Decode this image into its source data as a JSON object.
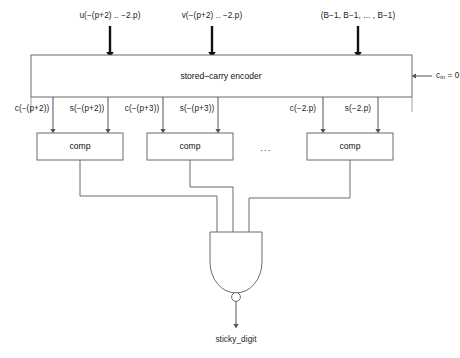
{
  "diagram": {
    "colors": {
      "line": "#6b6b6b",
      "arrow_bold": "#111111",
      "text": "#1a1a1a",
      "background": "#ffffff"
    },
    "inputs": [
      {
        "id": "u-input",
        "label": "u(−(p+2) .. −2.p)"
      },
      {
        "id": "v-input",
        "label": "v(−(p+2) .. −2.p)"
      },
      {
        "id": "b-input",
        "label": "(B−1, B−1, ... , B−1)"
      }
    ],
    "encoder": {
      "label": "stored–carry encoder",
      "carry_in_label": "c",
      "carry_in_sub": "in",
      "carry_in_value": " = 0"
    },
    "encoder_outputs": [
      {
        "id": "c-p2",
        "label": "c(−(p+2))"
      },
      {
        "id": "s-p2",
        "label": "s(−(p+2))"
      },
      {
        "id": "c-p3",
        "label": "c(−(p+3))"
      },
      {
        "id": "s-p3",
        "label": "s(−(p+3))"
      },
      {
        "id": "c-2p",
        "label": "c(−2.p)"
      },
      {
        "id": "s-2p",
        "label": "s(−2.p)"
      }
    ],
    "comparators": [
      {
        "id": "comp-1",
        "label": "comp"
      },
      {
        "id": "comp-2",
        "label": "comp"
      },
      {
        "id": "comp-3",
        "label": "comp"
      }
    ],
    "ellipsis": "...",
    "gate": {
      "type": "nand",
      "inputs": 3
    },
    "output": {
      "label": "sticky_digit"
    }
  }
}
